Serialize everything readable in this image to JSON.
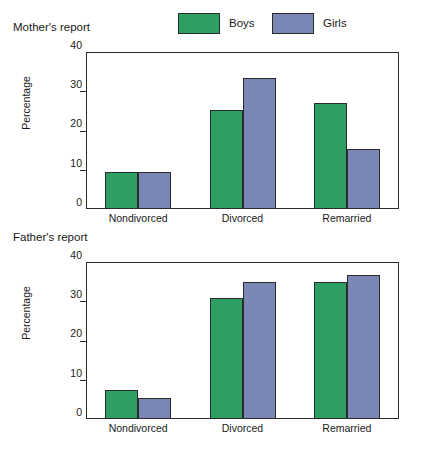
{
  "figure": {
    "background": "#ffffff",
    "panels": [
      {
        "title": "Mother's report"
      },
      {
        "title": "Father's report"
      }
    ]
  },
  "legend": {
    "position": "top-center",
    "entries": [
      {
        "label": "Boys",
        "color": "#2f9e63"
      },
      {
        "label": "Girls",
        "color": "#7a86b4"
      }
    ]
  },
  "colors": {
    "boys": "#2f9e63",
    "girls": "#7a86b4",
    "outline": "#2b2b2b",
    "text": "#1a1a1a",
    "background": "#ffffff"
  },
  "chart_data": [
    {
      "type": "bar",
      "title": "Mother's report",
      "xlabel": "",
      "ylabel": "Percentage",
      "categories": [
        "Nondivorced",
        "Divorced",
        "Remarried"
      ],
      "series": [
        {
          "name": "Boys",
          "color": "#2f9e63",
          "values": [
            9.5,
            25.3,
            27.0
          ]
        },
        {
          "name": "Girls",
          "color": "#7a86b4",
          "values": [
            9.5,
            33.5,
            15.4
          ]
        }
      ],
      "ylim": [
        0,
        40
      ],
      "yticks": [
        0,
        10,
        20,
        30,
        40
      ],
      "ytick_labels": [
        "0",
        "10",
        "20",
        "30",
        "40"
      ],
      "grid": false,
      "legend_position": "above-plot"
    },
    {
      "type": "bar",
      "title": "Father's report",
      "xlabel": "",
      "ylabel": "Percentage",
      "categories": [
        "Nondivorced",
        "Divorced",
        "Remarried"
      ],
      "series": [
        {
          "name": "Boys",
          "color": "#2f9e63",
          "values": [
            7.3,
            30.8,
            35.0
          ]
        },
        {
          "name": "Girls",
          "color": "#7a86b4",
          "values": [
            5.3,
            35.0,
            36.8
          ]
        }
      ],
      "ylim": [
        0,
        40
      ],
      "yticks": [
        0,
        10,
        20,
        30,
        40
      ],
      "ytick_labels": [
        "0",
        "10",
        "20",
        "30",
        "40"
      ],
      "grid": false,
      "legend_position": "shared-above-first-panel"
    }
  ]
}
